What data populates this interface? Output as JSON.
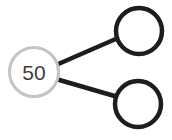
{
  "diagram": {
    "type": "number-bond",
    "whole": {
      "value": "50"
    },
    "parts": [
      {
        "value": ""
      },
      {
        "value": ""
      }
    ],
    "colors": {
      "whole_circle_border": "#c3c3c3",
      "part_circle_border": "#1d1d1d",
      "connector_line": "#1d1d1d",
      "value_text": "#3e3e3e",
      "background": "#ffffff"
    }
  }
}
